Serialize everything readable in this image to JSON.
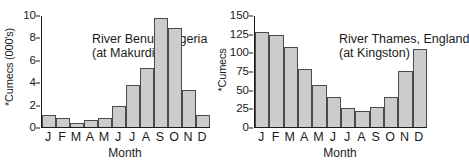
{
  "chart_data": [
    {
      "type": "bar",
      "title": "River Benue, Nigeria",
      "subtitle": "(at Makurdi)",
      "xlabel": "Month",
      "ylabel": "*Cumecs (000's)",
      "categories": [
        "J",
        "F",
        "M",
        "A",
        "M",
        "J",
        "J",
        "A",
        "S",
        "O",
        "N",
        "D"
      ],
      "values": [
        1.05,
        0.8,
        0.35,
        0.65,
        0.85,
        1.9,
        3.8,
        5.35,
        9.8,
        8.9,
        3.3,
        1.05
      ],
      "ylim": [
        0,
        10
      ],
      "yticks": [
        0,
        2,
        4,
        6,
        8,
        10
      ],
      "grid": false,
      "legend": "none",
      "bar_fill": "#cccccc",
      "bar_stroke": "#4a4a4a"
    },
    {
      "type": "bar",
      "title": "River Thames, England",
      "subtitle": "(at Kingston)",
      "xlabel": "Month",
      "ylabel": "*Cumecs",
      "categories": [
        "J",
        "F",
        "M",
        "A",
        "M",
        "J",
        "J",
        "A",
        "S",
        "O",
        "N",
        "D"
      ],
      "values": [
        128,
        124,
        108,
        78,
        57,
        41,
        26,
        22,
        27,
        40,
        76,
        105
      ],
      "ylim": [
        0,
        150
      ],
      "yticks": [
        0,
        25,
        50,
        75,
        100,
        125,
        150
      ],
      "grid": false,
      "legend": "none",
      "bar_fill": "#cccccc",
      "bar_stroke": "#4a4a4a"
    }
  ]
}
